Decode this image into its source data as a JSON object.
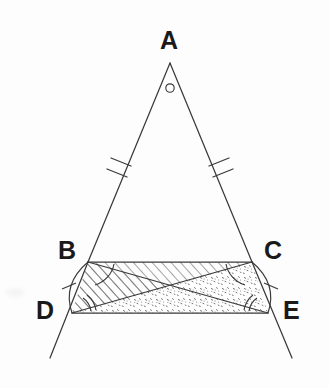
{
  "figure": {
    "background_color": "#fdfdfd",
    "stroke_color": "#3a3a3a",
    "label_color": "#1a1a1a",
    "hatch_color": "#5a5a5a",
    "stipple_color": "#6a6a6a"
  },
  "labels": {
    "apex": "A",
    "base_left": "B",
    "base_right": "C",
    "lower_left": "D",
    "lower_right": "E"
  },
  "points": {
    "A": {
      "x": 170,
      "y": 63
    },
    "B": {
      "x": 88,
      "y": 262
    },
    "C": {
      "x": 252,
      "y": 262
    },
    "D": {
      "x": 72,
      "y": 313
    },
    "E": {
      "x": 268,
      "y": 313
    },
    "intersection": {
      "x": 170,
      "y": 287
    },
    "ray_left_end": {
      "x": 50,
      "y": 358
    },
    "ray_right_end": {
      "x": 292,
      "y": 358
    }
  },
  "label_positions": {
    "A": {
      "x": 160,
      "y": 28
    },
    "B": {
      "x": 58,
      "y": 238
    },
    "C": {
      "x": 264,
      "y": 238
    },
    "D": {
      "x": 36,
      "y": 298
    },
    "E": {
      "x": 283,
      "y": 298
    }
  },
  "marks": {
    "apex_angle": {
      "type": "circle-angle-marker",
      "x": 170,
      "y": 88,
      "r": 4
    },
    "side_ticks": [
      {
        "name": "tick-AB",
        "count": 2,
        "side": "AB"
      },
      {
        "name": "tick-AC",
        "count": 2,
        "side": "AC"
      }
    ],
    "arc_ticks": [
      {
        "name": "tick-arc-BD",
        "count": 1,
        "arc": "BD"
      },
      {
        "name": "tick-arc-CE",
        "count": 1,
        "arc": "CE"
      }
    ],
    "angle_arcs": [
      {
        "name": "angle-arc-B",
        "vertex": "B",
        "count": 1
      },
      {
        "name": "angle-arc-C",
        "vertex": "C",
        "count": 1
      },
      {
        "name": "angle-arc-D",
        "vertex": "D",
        "count": 2
      },
      {
        "name": "angle-arc-E",
        "vertex": "E",
        "count": 2
      }
    ]
  },
  "regions": [
    {
      "name": "triangle-BDE",
      "fill": "diagonal-hatch",
      "vertices": [
        "B",
        "D",
        "E"
      ]
    },
    {
      "name": "triangle-CDE",
      "fill": "stipple-dots",
      "vertices": [
        "C",
        "D",
        "E"
      ]
    }
  ],
  "segments": [
    {
      "name": "segment-AB",
      "from": "A",
      "to": "B"
    },
    {
      "name": "segment-AC",
      "from": "A",
      "to": "C"
    },
    {
      "name": "segment-BC",
      "from": "B",
      "to": "C"
    },
    {
      "name": "segment-BE",
      "from": "B",
      "to": "E"
    },
    {
      "name": "segment-CD",
      "from": "C",
      "to": "D"
    },
    {
      "name": "segment-DE",
      "from": "D",
      "to": "E"
    },
    {
      "name": "ray-BD-extended",
      "from": "B",
      "to": "ray_left_end"
    },
    {
      "name": "ray-CE-extended",
      "from": "C",
      "to": "ray_right_end"
    },
    {
      "name": "arc-BD",
      "from": "B",
      "to": "D"
    },
    {
      "name": "arc-CE",
      "from": "C",
      "to": "E"
    }
  ]
}
